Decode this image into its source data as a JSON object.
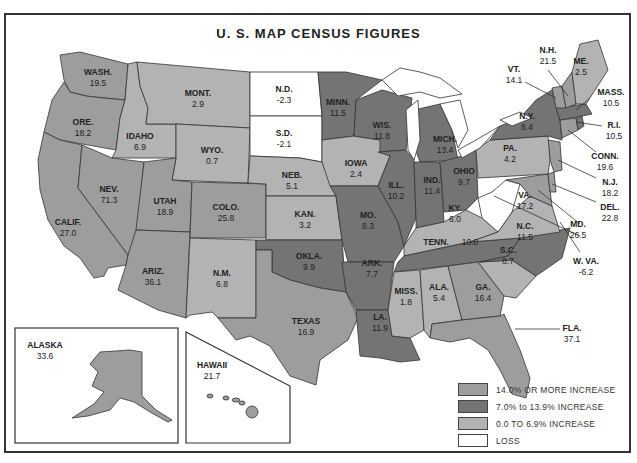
{
  "title": "U. S. MAP CENSUS FIGURES",
  "colors": {
    "increase_14_plus": "#9d9d9d",
    "increase_7_to_13_9": "#747474",
    "increase_0_to_6_9": "#b3b3b3",
    "loss": "#ffffff",
    "border": "#333333"
  },
  "legend": [
    {
      "label": "14.0% OR MORE INCREASE",
      "color": "#9d9d9d"
    },
    {
      "label": "7.0% to 13.9% INCREASE",
      "color": "#747474"
    },
    {
      "label": "0.0 TO 6.9% INCREASE",
      "color": "#b3b3b3"
    },
    {
      "label": "LOSS",
      "color": "#ffffff"
    }
  ],
  "states": {
    "wash": {
      "name": "WASH.",
      "value": "19.5"
    },
    "ore": {
      "name": "ORE.",
      "value": "18.2"
    },
    "calif": {
      "name": "CALIF.",
      "value": "27.0"
    },
    "idaho": {
      "name": "IDAHO",
      "value": "6.9"
    },
    "nev": {
      "name": "NEV.",
      "value": "71.3"
    },
    "mont": {
      "name": "MONT.",
      "value": "2.9"
    },
    "wyo": {
      "name": "WYO.",
      "value": "0.7"
    },
    "utah": {
      "name": "UTAH",
      "value": "18.9"
    },
    "ariz": {
      "name": "ARIZ.",
      "value": "36.1"
    },
    "colo": {
      "name": "COLO.",
      "value": "25.8"
    },
    "nm": {
      "name": "N.M.",
      "value": "6.8"
    },
    "nd": {
      "name": "N.D.",
      "value": "-2.3"
    },
    "sd": {
      "name": "S.D.",
      "value": "-2.1"
    },
    "neb": {
      "name": "NEB.",
      "value": "5.1"
    },
    "kan": {
      "name": "KAN.",
      "value": "3.2"
    },
    "okla": {
      "name": "OKLA.",
      "value": "9.9"
    },
    "texas": {
      "name": "TEXAS",
      "value": "16.9"
    },
    "minn": {
      "name": "MINN.",
      "value": "11.5"
    },
    "iowa": {
      "name": "IOWA",
      "value": "2.4"
    },
    "mo": {
      "name": "MO.",
      "value": "8.3"
    },
    "ark": {
      "name": "ARK.",
      "value": "7.7"
    },
    "la": {
      "name": "LA.",
      "value": "11.9"
    },
    "wis": {
      "name": "WIS.",
      "value": "11.8"
    },
    "ill": {
      "name": "ILL.",
      "value": "10.2"
    },
    "mich": {
      "name": "MICH.",
      "value": "13.4"
    },
    "ind": {
      "name": "IND.",
      "value": "11.4"
    },
    "ohio": {
      "name": "OHIO",
      "value": "9.7"
    },
    "ky": {
      "name": "KY.",
      "value": "6.0"
    },
    "tenn": {
      "name": "TENN.",
      "value": "10.0"
    },
    "miss": {
      "name": "MISS.",
      "value": "1.8"
    },
    "ala": {
      "name": "ALA.",
      "value": "5.4"
    },
    "ga": {
      "name": "GA.",
      "value": "16.4"
    },
    "fla": {
      "name": "FLA.",
      "value": "37.1"
    },
    "sc": {
      "name": "S.C.",
      "value": "8.7"
    },
    "nc": {
      "name": "N.C.",
      "value": "11.5"
    },
    "va": {
      "name": "VA.",
      "value": "17.2"
    },
    "wva": {
      "name": "W. VA.",
      "value": "-6.2"
    },
    "md": {
      "name": "MD.",
      "value": "26.5"
    },
    "del": {
      "name": "DEL.",
      "value": "22.8"
    },
    "nj": {
      "name": "N.J.",
      "value": "18.2"
    },
    "pa": {
      "name": "PA.",
      "value": "4.2"
    },
    "ny": {
      "name": "N.Y.",
      "value": "8.4"
    },
    "conn": {
      "name": "CONN.",
      "value": "19.6"
    },
    "ri": {
      "name": "R.I.",
      "value": "10.5"
    },
    "mass": {
      "name": "MASS.",
      "value": "10.5"
    },
    "vt": {
      "name": "VT.",
      "value": "14.1"
    },
    "nh": {
      "name": "N.H.",
      "value": "21.5"
    },
    "me": {
      "name": "ME.",
      "value": "2.5"
    },
    "alaska": {
      "name": "ALASKA",
      "value": "33.6"
    },
    "hawaii": {
      "name": "HAWAII",
      "value": "21.7"
    }
  }
}
